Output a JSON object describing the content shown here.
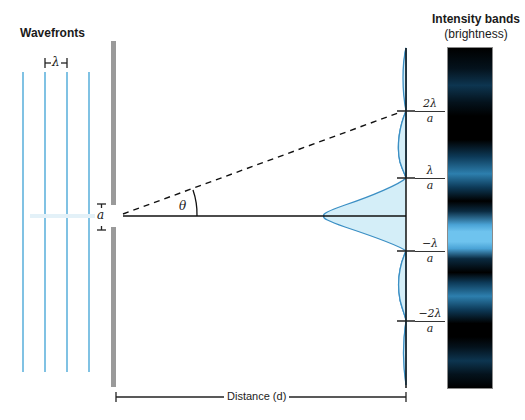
{
  "labels": {
    "wavefronts": "Wavefronts",
    "wavelength": "λ",
    "slit_width": "a",
    "angle": "θ",
    "intensity_title": "Intensity bands",
    "intensity_subtitle": "(brightness)",
    "distance": "Distance (d)"
  },
  "screen_ticks": [
    {
      "num": "2λ",
      "den": "a",
      "y": 111
    },
    {
      "num": "λ",
      "den": "a",
      "y": 178
    },
    {
      "num": "−λ",
      "den": "a",
      "y": 251
    },
    {
      "num": "−2λ",
      "den": "a",
      "y": 321
    }
  ],
  "colors": {
    "wave": "#4aa8d8",
    "curve_stroke": "#3b8fc4",
    "curve_fill": "#d4eef8",
    "barrier": "#9a9a9a",
    "band_bright": "#6ec3ee",
    "band_dark": "#000000"
  },
  "intensity_profile": {
    "description": "Single-slit diffraction intensity, central max at y=216",
    "maxima": [
      {
        "order": 0,
        "relative_intensity": 1.0
      },
      {
        "order": 1,
        "relative_intensity": 0.047
      },
      {
        "order": 2,
        "relative_intensity": 0.016
      }
    ]
  }
}
